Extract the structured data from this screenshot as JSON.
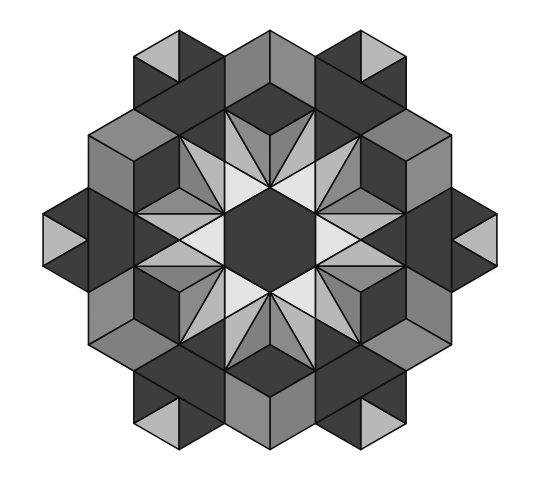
{
  "figure": {
    "type": "hexagonal-star-tessellation",
    "symmetry": "6-fold rotational",
    "center_px": [
      270,
      240
    ],
    "lattice_unit_px": {
      "x": 45.4,
      "y": 26.2
    },
    "colors": {
      "dark": "#3d3d3d",
      "mid": "#808080",
      "mid_alt": "#8a8a8a",
      "light": "#b8b8b8",
      "white": "#e4e4e4",
      "stroke": "#111111",
      "background": "#ffffff"
    },
    "center_hexagon": {
      "color": "dark",
      "points": [
        [
          0,
          -2
        ],
        [
          1,
          -1
        ],
        [
          1,
          1
        ],
        [
          0,
          2
        ],
        [
          -1,
          1
        ],
        [
          -1,
          -1
        ]
      ]
    },
    "sector_polygons": [
      {
        "name": "fan-outer-left",
        "color": "light",
        "points": [
          [
            0,
            -2
          ],
          [
            -1,
            -3
          ],
          [
            -1,
            -5
          ]
        ]
      },
      {
        "name": "fan-inner-left",
        "color": "mid_alt",
        "points": [
          [
            0,
            -2
          ],
          [
            -1,
            -5
          ],
          [
            0,
            -4
          ]
        ]
      },
      {
        "name": "fan-inner-right",
        "color": "mid",
        "points": [
          [
            0,
            -2
          ],
          [
            0,
            -4
          ],
          [
            1,
            -5
          ]
        ]
      },
      {
        "name": "fan-outer-right",
        "color": "light",
        "points": [
          [
            0,
            -2
          ],
          [
            1,
            -5
          ],
          [
            1,
            -3
          ]
        ]
      },
      {
        "name": "star-gap",
        "color": "white",
        "points": [
          [
            1,
            -3
          ],
          [
            0,
            -2
          ],
          [
            1,
            -1
          ]
        ]
      },
      {
        "name": "dark-wedge",
        "color": "dark",
        "points": [
          [
            1,
            -5
          ],
          [
            2,
            -4
          ],
          [
            1,
            -3
          ]
        ]
      },
      {
        "name": "cube-bottom-face",
        "color": "dark",
        "points": [
          [
            0,
            -6
          ],
          [
            1,
            -5
          ],
          [
            0,
            -4
          ],
          [
            -1,
            -5
          ]
        ]
      },
      {
        "name": "cube-left-face",
        "color": "mid",
        "points": [
          [
            0,
            -8
          ],
          [
            0,
            -6
          ],
          [
            -1,
            -5
          ],
          [
            -1,
            -7
          ]
        ]
      },
      {
        "name": "cube-right-face",
        "color": "mid_alt",
        "points": [
          [
            0,
            -8
          ],
          [
            1,
            -7
          ],
          [
            1,
            -5
          ],
          [
            0,
            -6
          ]
        ]
      },
      {
        "name": "notch-light",
        "color": "light",
        "points": [
          [
            2,
            -8
          ],
          [
            3,
            -7
          ],
          [
            2,
            -6
          ]
        ]
      },
      {
        "name": "notch-dark-top",
        "color": "dark",
        "points": [
          [
            2,
            -8
          ],
          [
            1,
            -7
          ],
          [
            2,
            -6
          ]
        ]
      },
      {
        "name": "notch-dark-side",
        "color": "dark",
        "points": [
          [
            3,
            -7
          ],
          [
            2,
            -6
          ],
          [
            3,
            -5
          ]
        ]
      },
      {
        "name": "notch-band",
        "color": "dark",
        "points": [
          [
            1,
            -7
          ],
          [
            3,
            -5
          ],
          [
            2,
            -4
          ],
          [
            1,
            -5
          ]
        ]
      }
    ],
    "rotations_deg": [
      0,
      60,
      120,
      180,
      240,
      300
    ]
  }
}
